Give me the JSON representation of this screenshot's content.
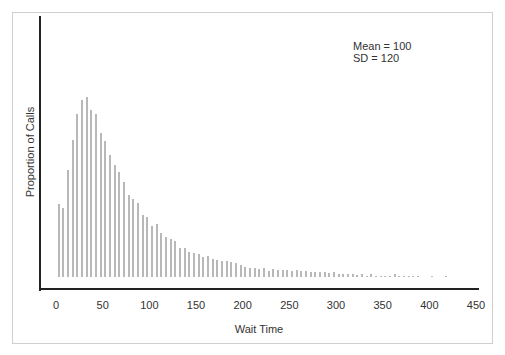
{
  "chart_data": {
    "type": "bar",
    "title": "",
    "xlabel": "Wait Time",
    "ylabel": "Proportion of Calls",
    "x_ticks": [
      0,
      50,
      100,
      150,
      200,
      250,
      300,
      350,
      400,
      450
    ],
    "xlim": [
      -20,
      450
    ],
    "annotations": [
      "Mean = 100",
      "SD = 120"
    ],
    "grid": false,
    "legend": "none",
    "bar_color": "#b8b8b8",
    "series": [
      {
        "name": "Wait time distribution",
        "x": [
          3,
          8,
          13,
          18,
          23,
          28,
          33,
          38,
          43,
          48,
          53,
          58,
          63,
          68,
          73,
          78,
          83,
          88,
          93,
          98,
          103,
          108,
          113,
          118,
          123,
          128,
          133,
          138,
          143,
          148,
          153,
          158,
          163,
          168,
          173,
          178,
          183,
          188,
          193,
          198,
          203,
          208,
          213,
          218,
          223,
          228,
          233,
          238,
          243,
          248,
          253,
          258,
          263,
          268,
          273,
          278,
          283,
          288,
          293,
          298,
          303,
          308,
          313,
          318,
          323,
          328,
          333,
          338,
          343,
          348,
          353,
          358,
          363,
          368,
          373,
          378,
          383,
          388,
          403,
          418
        ],
        "values": [
          73,
          69,
          107,
          137,
          163,
          177,
          180,
          167,
          163,
          144,
          136,
          122,
          112,
          105,
          95,
          82,
          78,
          74,
          62,
          60,
          51,
          53,
          44,
          40,
          38,
          36,
          29,
          29,
          25,
          24,
          23,
          20,
          21,
          18,
          17,
          16,
          16,
          15,
          14,
          12,
          10,
          9,
          9,
          8,
          9,
          6,
          8,
          7,
          7,
          7,
          6,
          7,
          6,
          6,
          5,
          5,
          5,
          5,
          4,
          5,
          3,
          3,
          3,
          3,
          2,
          3,
          1,
          3,
          1,
          1,
          1,
          1,
          3,
          1,
          1,
          1,
          1,
          1,
          1,
          1
        ]
      }
    ]
  }
}
